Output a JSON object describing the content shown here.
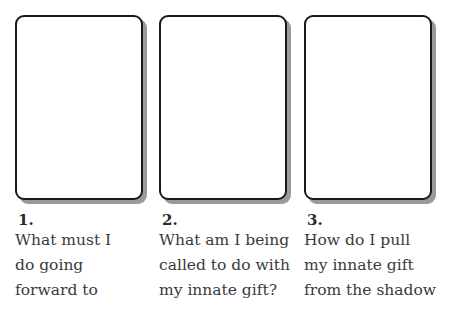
{
  "spread": {
    "card_border_color": "#1a1a1a",
    "card_shadow_color": "#9a9a9a",
    "positions": [
      {
        "number": "1.",
        "question_lines": [
          "What must I",
          "do going",
          "forward to"
        ]
      },
      {
        "number": "2.",
        "question_lines": [
          "What am I being",
          "called to do with",
          "my innate gift?"
        ]
      },
      {
        "number": "3.",
        "question_lines": [
          "How do I pull",
          "my innate gift",
          "from the shadow"
        ]
      }
    ]
  }
}
